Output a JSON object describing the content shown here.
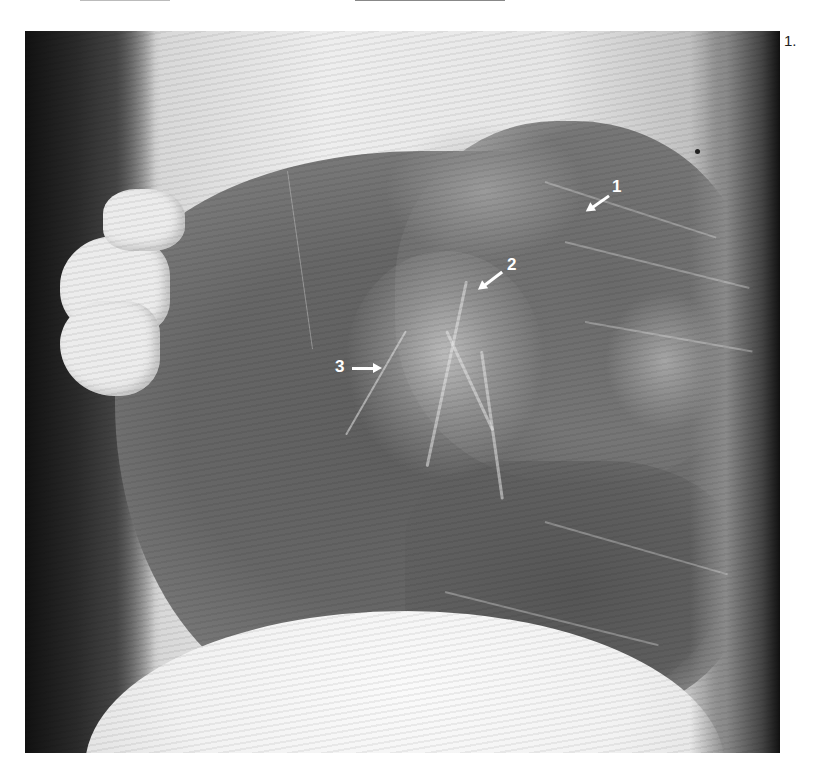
{
  "figure": {
    "label": "1.",
    "type": "lateral chest radiograph"
  },
  "annotations": [
    {
      "number": "1",
      "x": 612,
      "y": 186,
      "arrow_direction": "down-left"
    },
    {
      "number": "2",
      "x": 506,
      "y": 261,
      "arrow_direction": "down-left"
    },
    {
      "number": "3",
      "x": 335,
      "y": 358,
      "arrow_direction": "right"
    }
  ]
}
